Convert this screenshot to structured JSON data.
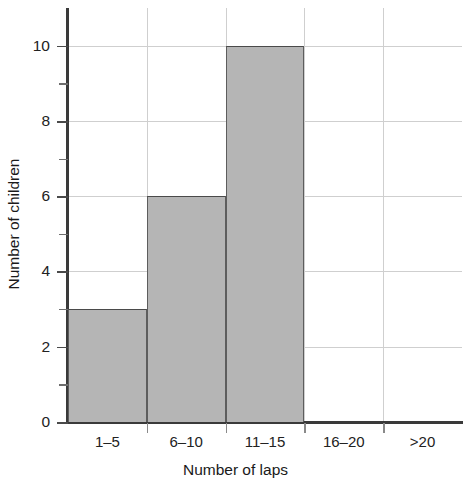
{
  "chart_data": {
    "type": "bar",
    "title": "",
    "subtitle": "",
    "xlabel": "Number of laps",
    "ylabel": "Number of children",
    "categories": [
      "1–5",
      "6–10",
      "11–15",
      "16–20",
      ">20"
    ],
    "values": [
      3,
      6,
      10,
      0,
      0
    ],
    "ylim": [
      0,
      11
    ],
    "xlim": [
      0,
      5
    ],
    "y_major_ticks": [
      0,
      2,
      4,
      6,
      8,
      10
    ],
    "y_minor_ticks": [
      1,
      3,
      5,
      7,
      9
    ],
    "y_tick_labels": [
      "0",
      "2",
      "4",
      "6",
      "8",
      "10"
    ],
    "grid": "major-xy",
    "legend": "none",
    "bar_fill_color": "#b5b5b5",
    "bar_edge_color": "#4a4a4a",
    "grid_color": "#cfcfcf",
    "axis_color": "#3a3a3a"
  }
}
